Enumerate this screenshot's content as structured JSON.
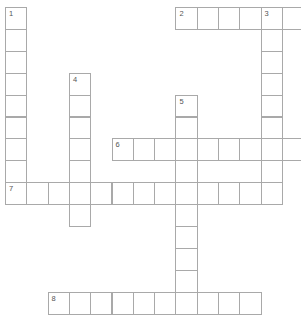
{
  "puzzle": {
    "type": "crossword",
    "grid": {
      "origin_x": 5,
      "origin_y": 7,
      "cell_w": 21.3,
      "cell_h": 21.9,
      "border_color": "#a9a9a9"
    },
    "clues": [
      {
        "number": "1",
        "direction": "down",
        "row": 0,
        "col": 0,
        "length": 9
      },
      {
        "number": "2",
        "direction": "across",
        "row": 0,
        "col": 8,
        "length": 6
      },
      {
        "number": "3",
        "direction": "down",
        "row": 0,
        "col": 12,
        "length": 9
      },
      {
        "number": "4",
        "direction": "down",
        "row": 3,
        "col": 3,
        "length": 7
      },
      {
        "number": "5",
        "direction": "down",
        "row": 4,
        "col": 8,
        "length": 10
      },
      {
        "number": "6",
        "direction": "across",
        "row": 6,
        "col": 5,
        "length": 9
      },
      {
        "number": "7",
        "direction": "across",
        "row": 8,
        "col": 0,
        "length": 13
      },
      {
        "number": "8",
        "direction": "across",
        "row": 13,
        "col": 2,
        "length": 10
      }
    ]
  }
}
